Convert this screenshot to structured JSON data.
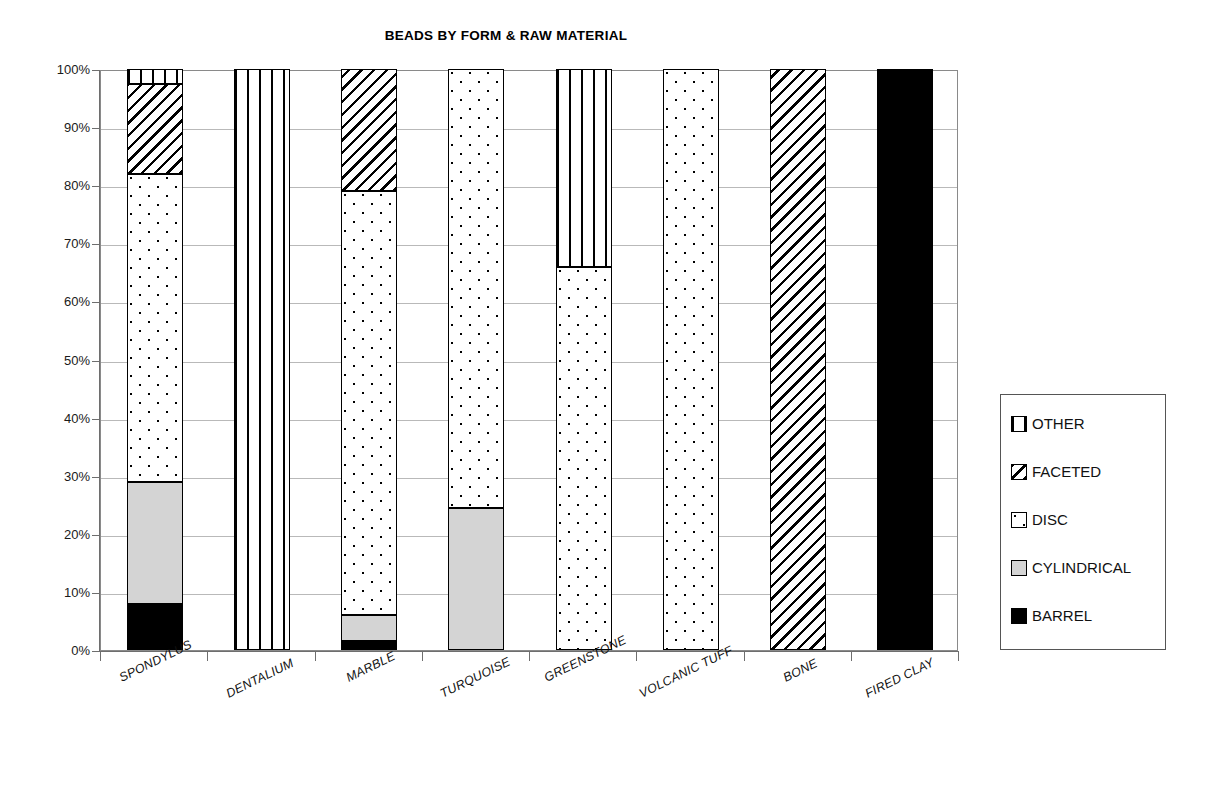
{
  "chart_data": {
    "type": "bar",
    "title": "BEADS BY FORM & RAW MATERIAL",
    "subtype": "stacked-100-percent",
    "xlabel": "",
    "ylabel": "",
    "ylim": [
      0,
      100
    ],
    "grid": true,
    "legend_position": "right",
    "categories": [
      "SPONDYLUS",
      "DENTALIUM",
      "MARBLE",
      "TURQUOISE",
      "GREENSTONE",
      "VOLCANIC TUFF",
      "BONE",
      "FIRED CLAY"
    ],
    "tick_labels": [
      "0%",
      "10%",
      "20%",
      "30%",
      "40%",
      "50%",
      "60%",
      "70%",
      "80%",
      "90%",
      "100%"
    ],
    "tick_values": [
      0,
      10,
      20,
      30,
      40,
      50,
      60,
      70,
      80,
      90,
      100
    ],
    "series": [
      {
        "name": "BARREL",
        "pattern": "solid-black",
        "values": [
          8,
          0,
          1.5,
          0,
          0,
          0,
          0,
          100
        ]
      },
      {
        "name": "CYLINDRICAL",
        "pattern": "solid-gray",
        "values": [
          21,
          0,
          4.5,
          24.5,
          0,
          0,
          0,
          0
        ]
      },
      {
        "name": "DISC",
        "pattern": "dotted",
        "values": [
          53,
          0,
          73,
          75.5,
          66,
          100,
          0,
          0
        ]
      },
      {
        "name": "FACETED",
        "pattern": "diagonal-hatch",
        "values": [
          15.5,
          0,
          21,
          0,
          0,
          0,
          100,
          0
        ]
      },
      {
        "name": "OTHER",
        "pattern": "vertical-stripe",
        "values": [
          2.5,
          100,
          0,
          0,
          34,
          0,
          0,
          0
        ]
      }
    ],
    "stack_order_bottom_to_top": [
      "BARREL",
      "CYLINDRICAL",
      "DISC",
      "FACETED",
      "OTHER"
    ]
  },
  "legend": {
    "items": [
      {
        "label": "OTHER",
        "pattern": "vertical-stripe"
      },
      {
        "label": "FACETED",
        "pattern": "diagonal-hatch"
      },
      {
        "label": "DISC",
        "pattern": "dotted"
      },
      {
        "label": "CYLINDRICAL",
        "pattern": "solid-gray"
      },
      {
        "label": "BARREL",
        "pattern": "solid-black"
      }
    ]
  },
  "colors": {
    "barrel": "#000000",
    "cylindrical": "#d4d4d4",
    "background": "#ffffff",
    "gridline": "#b9b9b9",
    "axis": "#6e6e6e"
  }
}
